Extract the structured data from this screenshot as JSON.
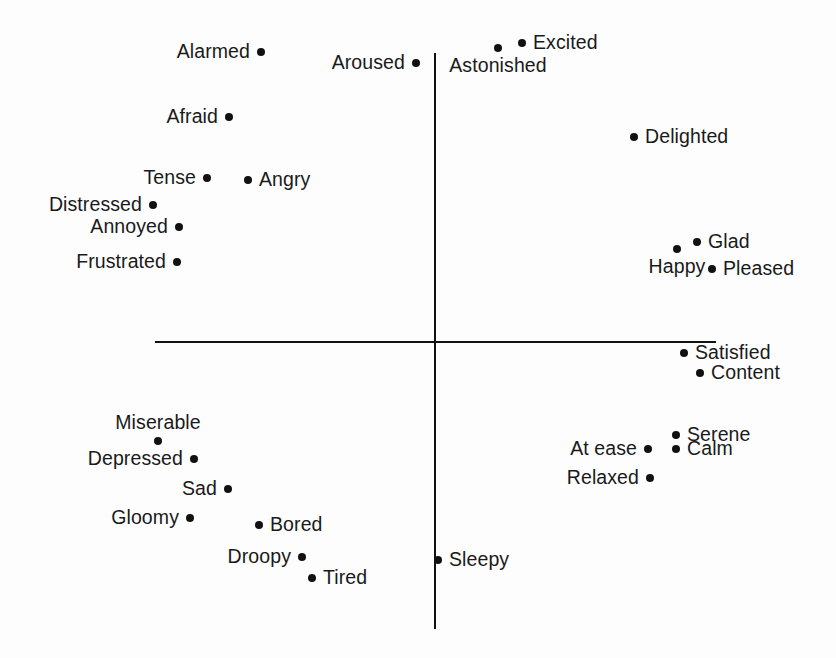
{
  "figure": {
    "background_color": "#fdfdfd",
    "ink_color": "#111111"
  },
  "axes": {
    "horizontal": {
      "x1": 155,
      "x2": 716,
      "y": 341,
      "thickness": 2
    },
    "vertical": {
      "y1": 53,
      "y2": 629,
      "x": 434,
      "thickness": 2
    },
    "origin": {
      "x": 434,
      "y": 341
    }
  },
  "chart_data": {
    "type": "scatter",
    "xlabel": "",
    "ylabel": "",
    "grid": false,
    "legend": "none",
    "axis_style": "crossed-axes-through-origin",
    "xlim": [
      -1,
      1
    ],
    "ylim": [
      -1,
      1
    ],
    "points": [
      {
        "label": "Alarmed",
        "px": 261,
        "py": 52,
        "x": -0.62,
        "y": 0.93,
        "anchor": "left"
      },
      {
        "label": "Aroused",
        "px": 416,
        "py": 63,
        "x": -0.06,
        "y": 0.89,
        "anchor": "left"
      },
      {
        "label": "Astonished",
        "px": 498,
        "py": 48,
        "x": 0.23,
        "y": 0.94,
        "anchor": "below"
      },
      {
        "label": "Excited",
        "px": 522,
        "py": 43,
        "x": 0.31,
        "y": 0.96,
        "anchor": "right"
      },
      {
        "label": "Delighted",
        "px": 634,
        "py": 137,
        "x": 0.71,
        "y": 0.63,
        "anchor": "right"
      },
      {
        "label": "Afraid",
        "px": 229,
        "py": 117,
        "x": -0.73,
        "y": 0.7,
        "anchor": "left"
      },
      {
        "label": "Tense",
        "px": 207,
        "py": 178,
        "x": -0.81,
        "y": 0.49,
        "anchor": "left"
      },
      {
        "label": "Angry",
        "px": 248,
        "py": 180,
        "x": -0.66,
        "y": 0.48,
        "anchor": "right"
      },
      {
        "label": "Distressed",
        "px": 153,
        "py": 205,
        "x": -1.0,
        "y": 0.39,
        "anchor": "left"
      },
      {
        "label": "Annoyed",
        "px": 179,
        "py": 227,
        "x": -0.91,
        "y": 0.31,
        "anchor": "left"
      },
      {
        "label": "Frustrated",
        "px": 177,
        "py": 262,
        "x": -0.92,
        "y": 0.19,
        "anchor": "left"
      },
      {
        "label": "Glad",
        "px": 697,
        "py": 242,
        "x": 0.94,
        "y": 0.26,
        "anchor": "right"
      },
      {
        "label": "Happy",
        "px": 677,
        "py": 249,
        "x": 0.86,
        "y": 0.24,
        "anchor": "below"
      },
      {
        "label": "Pleased",
        "px": 712,
        "py": 269,
        "x": 0.99,
        "y": 0.17,
        "anchor": "right"
      },
      {
        "label": "Satisfied",
        "px": 684,
        "py": 353,
        "x": 0.89,
        "y": -0.05,
        "anchor": "right"
      },
      {
        "label": "Content",
        "px": 700,
        "py": 373,
        "x": 0.95,
        "y": -0.12,
        "anchor": "right"
      },
      {
        "label": "Serene",
        "px": 676,
        "py": 435,
        "x": 0.86,
        "y": -0.34,
        "anchor": "right"
      },
      {
        "label": "Calm",
        "px": 676,
        "py": 449,
        "x": 0.86,
        "y": -0.38,
        "anchor": "right"
      },
      {
        "label": "At ease",
        "px": 648,
        "py": 449,
        "x": 0.76,
        "y": -0.38,
        "anchor": "left"
      },
      {
        "label": "Relaxed",
        "px": 650,
        "py": 478,
        "x": 0.77,
        "y": -0.48,
        "anchor": "left"
      },
      {
        "label": "Miserable",
        "px": 158,
        "py": 441,
        "x": -0.98,
        "y": -0.35,
        "anchor": "above"
      },
      {
        "label": "Depressed",
        "px": 194,
        "py": 459,
        "x": -0.85,
        "y": -0.41,
        "anchor": "left"
      },
      {
        "label": "Sad",
        "px": 228,
        "py": 489,
        "x": -0.73,
        "y": -0.51,
        "anchor": "left"
      },
      {
        "label": "Gloomy",
        "px": 190,
        "py": 518,
        "x": -0.87,
        "y": -0.61,
        "anchor": "left"
      },
      {
        "label": "Bored",
        "px": 259,
        "py": 525,
        "x": -0.62,
        "y": -0.64,
        "anchor": "right"
      },
      {
        "label": "Droopy",
        "px": 302,
        "py": 557,
        "x": -0.47,
        "y": -0.75,
        "anchor": "left"
      },
      {
        "label": "Tired",
        "px": 312,
        "py": 578,
        "x": -0.43,
        "y": -0.82,
        "anchor": "right"
      },
      {
        "label": "Sleepy",
        "px": 438,
        "py": 560,
        "x": 0.01,
        "y": -0.76,
        "anchor": "right"
      }
    ]
  }
}
